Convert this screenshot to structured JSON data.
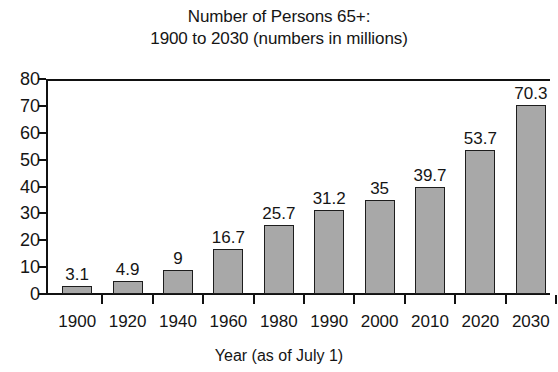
{
  "chart_data": {
    "type": "bar",
    "title": "Number of Persons 65+:\n1900 to 2030 (numbers in millions)",
    "title_lines": [
      "Number of Persons 65+:",
      "1900 to 2030 (numbers in millions)"
    ],
    "xlabel": "Year (as of July 1)",
    "ylabel": "",
    "categories": [
      "1900",
      "1920",
      "1940",
      "1960",
      "1980",
      "1990",
      "2000",
      "2010",
      "2020",
      "2030"
    ],
    "values": [
      3.1,
      4.9,
      9,
      16.7,
      25.7,
      31.2,
      35,
      39.7,
      53.7,
      70.3
    ],
    "value_labels": [
      "3.1",
      "4.9",
      "9",
      "16.7",
      "25.7",
      "31.2",
      "35",
      "39.7",
      "53.7",
      "70.3"
    ],
    "ylim": [
      0,
      80
    ],
    "ytick_labels": [
      "80",
      "70",
      "60",
      "50",
      "40",
      "30",
      "20",
      "10",
      "0"
    ],
    "ytick_values": [
      80,
      70,
      60,
      50,
      40,
      30,
      20,
      10,
      0
    ],
    "grid": false,
    "legend": null,
    "legend_position": "none",
    "bar_color": "#a8a8a8",
    "bar_edge_color": "#1d1d1d",
    "axis_color": "#111111",
    "background_color": "#ffffff"
  }
}
